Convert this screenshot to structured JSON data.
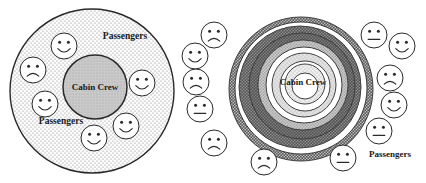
{
  "figure": {
    "panels": [
      {
        "id": "panel-left",
        "name": "integrated-cabin-crew-passengers",
        "center_label": "Cabin Crew",
        "ring_labels": [
          "Passengers",
          "Passengers"
        ],
        "outer_fill": "#f2f2f2",
        "outer_pattern": "stipple",
        "inner_fill": "#c9c9c9",
        "stroke": "#2a2a2a",
        "faces": [
          {
            "expression": "happy",
            "cx": 64,
            "cy": 46,
            "r": 13
          },
          {
            "expression": "sad",
            "cx": 33,
            "cy": 70,
            "r": 13
          },
          {
            "expression": "happy",
            "cx": 45,
            "cy": 104,
            "r": 13
          },
          {
            "expression": "happy",
            "cx": 94,
            "cy": 138,
            "r": 13
          },
          {
            "expression": "happy",
            "cx": 126,
            "cy": 126,
            "r": 13
          },
          {
            "expression": "happy",
            "cx": 142,
            "cy": 83,
            "r": 13
          }
        ]
      },
      {
        "id": "panel-right",
        "name": "isolated-cabin-crew-barrier",
        "center_label": "Cabin Crew",
        "ring_labels": [
          "Passengers"
        ],
        "stroke": "#2a2a2a",
        "rings": [
          {
            "r": 72.0,
            "fill": "#bdbdbd",
            "pattern": "coarse"
          },
          {
            "r": 66.0,
            "fill": "#ffffff",
            "pattern": "none"
          },
          {
            "r": 61.0,
            "fill": "#9a9a9a",
            "pattern": "coarse"
          },
          {
            "r": 54.0,
            "fill": "#8a8a8a",
            "pattern": "coarse"
          },
          {
            "r": 46.0,
            "fill": "#cfcfcf",
            "pattern": "medium"
          },
          {
            "r": 39.0,
            "fill": "#ffffff",
            "pattern": "none"
          },
          {
            "r": 33.0,
            "fill": "#e2e2e2",
            "pattern": "fine"
          },
          {
            "r": 26.0,
            "fill": "#ffffff",
            "pattern": "none"
          },
          {
            "r": 21.0,
            "fill": "#ededed",
            "pattern": "fine"
          },
          {
            "r": 14.0,
            "fill": "#ffffff",
            "pattern": "none"
          }
        ],
        "faces": [
          {
            "expression": "sad",
            "cx": 214,
            "cy": 35,
            "r": 13
          },
          {
            "expression": "happy",
            "cx": 195,
            "cy": 56,
            "r": 13
          },
          {
            "expression": "sad",
            "cx": 196,
            "cy": 82,
            "r": 13
          },
          {
            "expression": "neutral",
            "cx": 200,
            "cy": 109,
            "r": 13
          },
          {
            "expression": "sad",
            "cx": 214,
            "cy": 143,
            "r": 13
          },
          {
            "expression": "sad",
            "cx": 264,
            "cy": 162,
            "r": 13
          },
          {
            "expression": "neutral",
            "cx": 343,
            "cy": 158,
            "r": 13
          },
          {
            "expression": "neutral",
            "cx": 379,
            "cy": 131,
            "r": 13
          },
          {
            "expression": "happy",
            "cx": 394,
            "cy": 105,
            "r": 13
          },
          {
            "expression": "sad",
            "cx": 390,
            "cy": 78,
            "r": 13
          },
          {
            "expression": "happy",
            "cx": 402,
            "cy": 46,
            "r": 13
          },
          {
            "expression": "neutral",
            "cx": 374,
            "cy": 35,
            "r": 13
          }
        ]
      }
    ]
  }
}
